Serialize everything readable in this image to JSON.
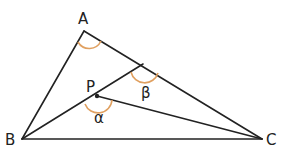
{
  "diagram": {
    "type": "triangle-geometry",
    "points": {
      "A": {
        "label": "A",
        "x": 84,
        "y": 31
      },
      "B": {
        "label": "B",
        "x": 22,
        "y": 139
      },
      "C": {
        "label": "C",
        "x": 262,
        "y": 139
      },
      "P": {
        "label": "P",
        "x": 97,
        "y": 96
      },
      "D": {
        "label": "",
        "x": 143,
        "y": 64
      }
    },
    "segments": [
      "AB",
      "AC",
      "BC",
      "BD",
      "PC"
    ],
    "angles": {
      "A": {
        "label": "",
        "vertex": "A"
      },
      "beta": {
        "label": "β",
        "vertex": "D"
      },
      "alpha": {
        "label": "α",
        "vertex": "P"
      }
    },
    "colors": {
      "line": "#222222",
      "arc": "#e0a060",
      "text": "#222222"
    }
  }
}
